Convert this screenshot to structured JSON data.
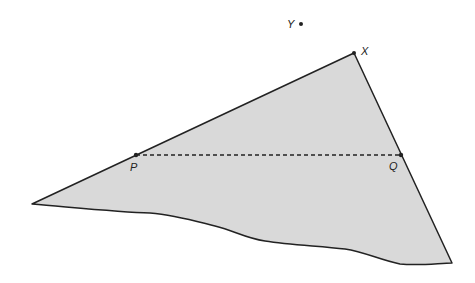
{
  "diagram": {
    "shape": {
      "fill": "#d9d9d9",
      "stroke": "#222222",
      "vertices": {
        "X": [
          354,
          53
        ],
        "left_tip": [
          32,
          204
        ],
        "bottom_right": [
          452,
          263
        ]
      }
    },
    "points": [
      {
        "label": "Y",
        "dot": [
          301,
          24
        ],
        "label_pos": [
          287,
          28
        ]
      },
      {
        "label": "X",
        "dot": [
          354,
          53
        ],
        "label_pos": [
          361,
          55
        ]
      },
      {
        "label": "P",
        "dot": [
          136,
          155
        ],
        "label_pos": [
          130,
          171
        ]
      },
      {
        "label": "Q",
        "dot": [
          401,
          155
        ],
        "label_pos": [
          389,
          170
        ]
      }
    ],
    "segment_PQ": {
      "style": "dashed",
      "from": "P",
      "to": "Q"
    }
  }
}
